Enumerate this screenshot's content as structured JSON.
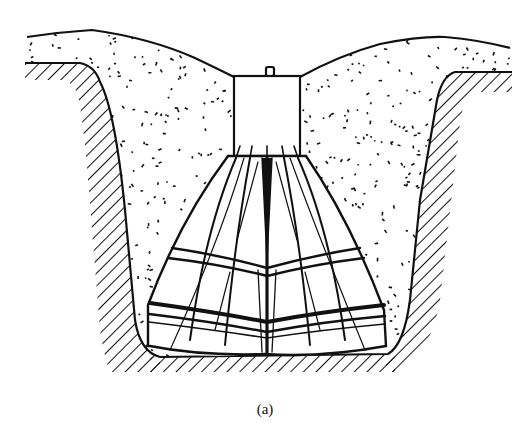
{
  "figure": {
    "type": "cross-section line drawing",
    "caption": "(a)",
    "colors": {
      "ink": "#111111",
      "background": "#ffffff"
    },
    "elements": [
      {
        "id": "ground-left",
        "label": "hatched natural ground (left)"
      },
      {
        "id": "ground-right",
        "label": "hatched natural ground (right)"
      },
      {
        "id": "ground-bottom",
        "label": "hatched trench bottom"
      },
      {
        "id": "backfill",
        "label": "stippled granular backfill"
      },
      {
        "id": "column",
        "label": "rectangular column with top lug"
      },
      {
        "id": "skirt",
        "label": "flared segmented base with horizontal bands"
      }
    ]
  }
}
